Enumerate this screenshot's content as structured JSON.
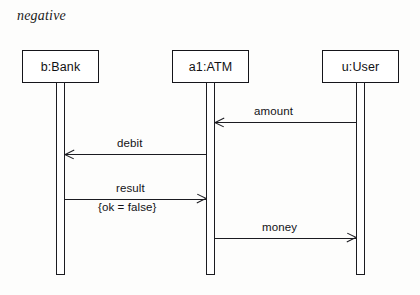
{
  "diagram": {
    "type": "uml-sequence-diagram",
    "frame_label": "negative",
    "lifelines": [
      {
        "id": "bank",
        "label": "b:Bank",
        "x": 22,
        "activation_x": 56
      },
      {
        "id": "atm",
        "label": "a1:ATM",
        "x": 172,
        "activation_x": 206
      },
      {
        "id": "user",
        "label": "u:User",
        "x": 322,
        "activation_x": 356
      }
    ],
    "messages": [
      {
        "id": "amount",
        "label": "amount",
        "from": "user",
        "to": "atm",
        "direction": "left",
        "y": 122,
        "constraint": ""
      },
      {
        "id": "debit",
        "label": "debit",
        "from": "atm",
        "to": "bank",
        "direction": "left",
        "y": 154,
        "constraint": ""
      },
      {
        "id": "result",
        "label": "result",
        "from": "bank",
        "to": "atm",
        "direction": "right",
        "y": 199,
        "constraint": "{ok = false}"
      },
      {
        "id": "money",
        "label": "money",
        "from": "atm",
        "to": "user",
        "direction": "right",
        "y": 238,
        "constraint": ""
      }
    ]
  },
  "background_text": {
    "line1": "",
    "line2": "",
    "line3": "",
    "line4": ""
  }
}
